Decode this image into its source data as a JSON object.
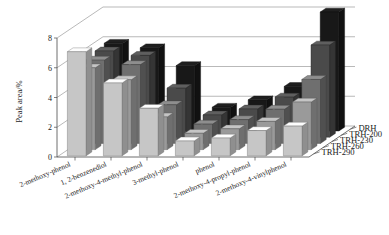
{
  "chart_data": {
    "type": "bar",
    "title": "",
    "xlabel": "",
    "ylabel": "Peak area/%",
    "ylim": [
      0,
      8
    ],
    "yticks": [
      0,
      2,
      4,
      6,
      8
    ],
    "grid": true,
    "projection": "3d",
    "legend_position": "right",
    "categories": [
      "2-methoxy-phenol",
      "1, 2-benzenediol",
      "2-methoxy-4-methyl-phenol",
      "3-methyl-phenol",
      "phenol",
      "2-methoxy-4-propyl-phenol",
      "2-methoxy-4-vinylphenol"
    ],
    "series": [
      {
        "name": "DRH",
        "color": "#181818",
        "values": [
          5.9,
          5.6,
          4.4,
          1.6,
          2.1,
          3.0,
          8.0
        ]
      },
      {
        "name": "TRH-200",
        "color": "#4a4a4a",
        "values": [
          5.8,
          5.5,
          3.3,
          1.5,
          1.9,
          2.7,
          6.2
        ]
      },
      {
        "name": "TRH-230",
        "color": "#6f6f6f",
        "values": [
          5.6,
          5.3,
          2.6,
          1.3,
          1.6,
          2.3,
          4.3
        ]
      },
      {
        "name": "TRH-260",
        "color": "#9a9a9a",
        "values": [
          5.5,
          4.7,
          2.2,
          1.1,
          1.4,
          1.9,
          3.2
        ]
      },
      {
        "name": "TRH-290",
        "color": "#c6c6c6",
        "values": [
          7.0,
          4.9,
          3.2,
          1.0,
          1.2,
          1.7,
          2.0
        ]
      }
    ]
  },
  "axis": {
    "y_title": "Peak area/%",
    "y_ticks": [
      "0",
      "2",
      "4",
      "6",
      "8"
    ]
  },
  "legend": {
    "items": [
      "DRH",
      "TRH-200",
      "TRH-230",
      "TRH-260",
      "TRH-290"
    ]
  }
}
